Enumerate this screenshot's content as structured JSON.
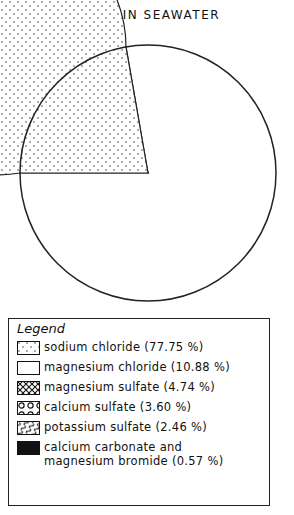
{
  "chart_data": {
    "type": "pie",
    "title": "SALTS IN SEAWATER",
    "categories": [
      "sodium chloride",
      "magnesium chloride",
      "magnesium sulfate",
      "calcium sulfate",
      "potassium sulfate",
      "calcium carbonate and magnesium bromide"
    ],
    "values": [
      77.75,
      10.88,
      4.74,
      3.6,
      2.46,
      0.57
    ],
    "unit": "%",
    "patterns": [
      "dots",
      "blank",
      "crosshatch",
      "circles",
      "wavy-lines",
      "solid-black"
    ],
    "legend_position": "bottom",
    "start_angle_deg": 180,
    "direction": "counterclockwise"
  },
  "legend": {
    "title": "Legend",
    "items": [
      {
        "label": "sodium chloride (77.75 %)",
        "pattern": "dots"
      },
      {
        "label": "magnesium chloride (10.88 %)",
        "pattern": "blank"
      },
      {
        "label": "magnesium sulfate (4.74 %)",
        "pattern": "crosshatch"
      },
      {
        "label": "calcium sulfate (3.60 %)",
        "pattern": "circles"
      },
      {
        "label": "potassium sulfate (2.46 %)",
        "pattern": "wavy-lines"
      },
      {
        "label": "calcium carbonate and magnesium bromide (0.57 %)",
        "pattern": "solid-black"
      }
    ]
  }
}
